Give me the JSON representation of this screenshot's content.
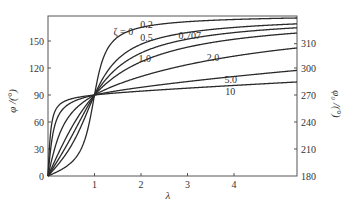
{
  "chart_data": {
    "type": "line",
    "title": "",
    "xlabel": "λ",
    "ylabel": "φ /(°)",
    "ylabel_right": "φ₀ /(°)",
    "xlim": [
      0,
      5.35
    ],
    "ylim": [
      0,
      174
    ],
    "x_ticks": [
      1,
      2,
      3,
      4
    ],
    "y_ticks": [
      0,
      30,
      60,
      90,
      120,
      150
    ],
    "y_ticks_right": [
      180,
      210,
      240,
      270,
      300,
      310
    ],
    "grid": false,
    "legend": "inline curve labels",
    "x": [
      0,
      0.5,
      1,
      2,
      3,
      4,
      5
    ],
    "series": [
      {
        "name": "ζ=0",
        "label": "ζ = 0",
        "values": [
          0,
          0,
          90,
          180,
          180,
          180,
          180
        ]
      },
      {
        "name": "ζ=0.2",
        "label": "0.2",
        "values": [
          0,
          14.9,
          90,
          165.1,
          171.5,
          173.9,
          175.2
        ]
      },
      {
        "name": "ζ=0.5",
        "label": "0.5",
        "values": [
          0,
          33.7,
          90,
          146.3,
          159.4,
          165.1,
          168.2
        ]
      },
      {
        "name": "ζ=0.707",
        "label": "0.707",
        "values": [
          0,
          43.3,
          90,
          136.7,
          152.1,
          159.3,
          163.5
        ]
      },
      {
        "name": "ζ=1.0",
        "label": "1.0",
        "values": [
          0,
          53.1,
          90,
          126.9,
          143.1,
          151.9,
          157.4
        ]
      },
      {
        "name": "ζ=2.0",
        "label": "2.0",
        "values": [
          0,
          69.4,
          90,
          110.6,
          123.7,
          133.2,
          140.1
        ]
      },
      {
        "name": "ζ=5.0",
        "label": "5.0",
        "values": [
          0,
          81.5,
          90,
          98.5,
          105.0,
          110.6,
          115.4
        ]
      },
      {
        "name": "ζ=10",
        "label": "10",
        "values": [
          0,
          85.7,
          90,
          94.3,
          97.6,
          100.7,
          103.3
        ]
      }
    ],
    "zetas": [
      0.2,
      0.5,
      0.707,
      1.0,
      2.0,
      5.0,
      10
    ],
    "label_positions": [
      {
        "text": "ζ = 0",
        "x": 1.62,
        "y": 157
      },
      {
        "text": "0.2",
        "x": 2.12,
        "y": 165
      },
      {
        "text": "0.5",
        "x": 2.12,
        "y": 150
      },
      {
        "text": "0.707",
        "x": 3.05,
        "y": 152
      },
      {
        "text": "1.0",
        "x": 2.08,
        "y": 127
      },
      {
        "text": "2.0",
        "x": 3.55,
        "y": 128
      },
      {
        "text": "5.0",
        "x": 3.93,
        "y": 103
      },
      {
        "text": "10",
        "x": 3.92,
        "y": 90
      }
    ],
    "colors": {
      "curve": "#2a2a2a",
      "axis": "#555555",
      "text": "#333333"
    }
  }
}
